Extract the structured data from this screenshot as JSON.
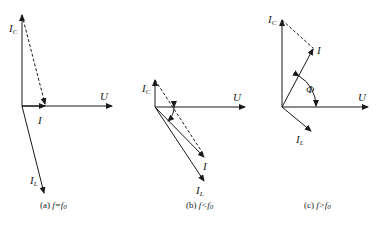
{
  "figure": {
    "panels": [
      {
        "id": "a",
        "caption_prefix": "(a) ",
        "caption_condition": "f=f",
        "caption_sub": "0",
        "labels": {
          "IC": "I",
          "IC_sub": "C",
          "IL": "I",
          "IL_sub": "L",
          "I": "I",
          "U": "U"
        }
      },
      {
        "id": "b",
        "caption_prefix": "(b) ",
        "caption_condition": "f<f",
        "caption_sub": "0",
        "labels": {
          "IC": "I",
          "IC_sub": "C",
          "IL": "I",
          "IL_sub": "L",
          "I": "I",
          "U": "U"
        }
      },
      {
        "id": "c",
        "caption_prefix": "(c) ",
        "caption_condition": "f>f",
        "caption_sub": "0",
        "labels": {
          "IC": "I",
          "IC_sub": "C",
          "IL": "I",
          "IL_sub": "L",
          "I": "I",
          "U": "U",
          "phi": "Φ"
        }
      }
    ],
    "colors": {
      "line": "#1a1a1a",
      "background": "#ffffff"
    }
  }
}
